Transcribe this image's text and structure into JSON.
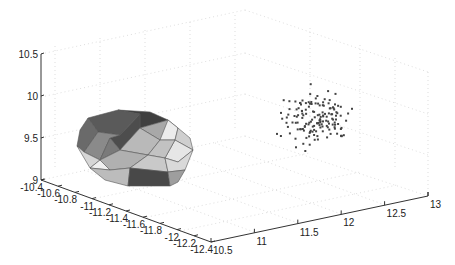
{
  "chart_data": {
    "type": "scatter3d",
    "title": "",
    "xlabel": "",
    "ylabel": "",
    "zlabel": "",
    "axes": {
      "x": {
        "ticks": [
          "10.5",
          "11",
          "11.5",
          "12",
          "12.5",
          "13"
        ],
        "range": [
          10.5,
          13
        ]
      },
      "y": {
        "ticks": [
          "-10.4",
          "-10.6",
          "-10.8",
          "-11",
          "-11.2",
          "-11.4",
          "-11.6",
          "-11.8",
          "-12",
          "-12.2",
          "-12.4"
        ],
        "range": [
          -12.4,
          -10.4
        ]
      },
      "z": {
        "ticks": [
          "9",
          "9.5",
          "10",
          "10.5"
        ],
        "range": [
          9,
          10.5
        ]
      }
    },
    "grid": true,
    "legend": null,
    "series": [
      {
        "name": "convex hull",
        "kind": "trisurf",
        "description": "Grey shaded triangulated convex polyhedron near x≈10.6–11, y≈-10.6–-11.6, z≈9.2–9.8"
      },
      {
        "name": "point cloud",
        "kind": "scatter",
        "approx_center": {
          "x": 12.0,
          "y": -10.9,
          "z": 9.9
        },
        "approx_count": 150,
        "marker": "small dark dot"
      }
    ]
  },
  "colors": {
    "axis": "#333333",
    "grid": "#c8c8c8",
    "points": "#444444",
    "hull_dark": "#4a4a4a",
    "hull_mid": "#8c8c8c",
    "hull_light": "#cfcfcf",
    "hull_highlight": "#ececec"
  }
}
